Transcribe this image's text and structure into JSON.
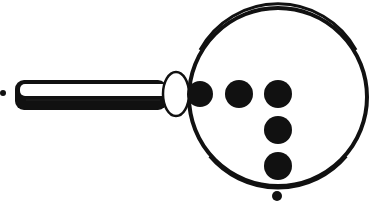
{
  "figure": {
    "colors": {
      "ink": "#111111",
      "paper": "#ffffff"
    },
    "lens": {
      "cx": 278,
      "cy": 97,
      "r": 90,
      "stroke": 5
    },
    "handle": {
      "x": 15,
      "y": 80,
      "width": 152,
      "height": 30
    },
    "collar": {
      "cx": 176,
      "cy": 94,
      "rx": 13,
      "ry": 22
    },
    "left_dot": {
      "cx": 3,
      "cy": 93,
      "r": 3
    },
    "bottom_dot": {
      "cx": 277,
      "cy": 196,
      "r": 5
    },
    "dots": [
      {
        "cx": 200,
        "cy": 94,
        "r": 13
      },
      {
        "cx": 239,
        "cy": 94,
        "r": 14
      },
      {
        "cx": 278,
        "cy": 94,
        "r": 14
      },
      {
        "cx": 278,
        "cy": 130,
        "r": 14
      },
      {
        "cx": 278,
        "cy": 166,
        "r": 14
      }
    ]
  }
}
